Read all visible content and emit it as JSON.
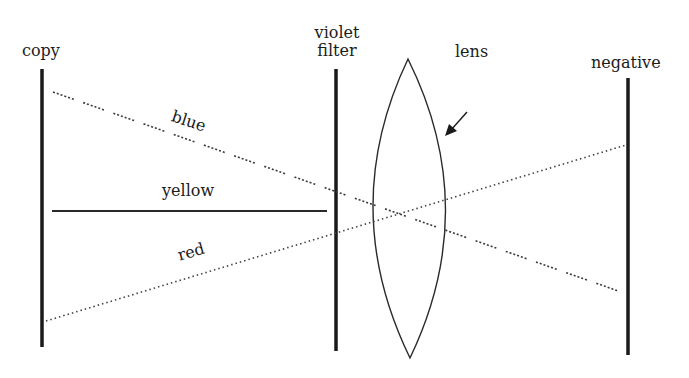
{
  "diagram": {
    "type": "optical-ray-diagram",
    "elements": {
      "copy": {
        "label": "copy"
      },
      "violet_filter": {
        "label_line1": "violet",
        "label_line2": "filter"
      },
      "lens": {
        "label": "lens"
      },
      "negative": {
        "label": "negative"
      }
    },
    "rays": {
      "blue": {
        "label": "blue",
        "style": "dashed"
      },
      "yellow": {
        "label": "yellow",
        "style": "solid"
      },
      "red": {
        "label": "red",
        "style": "dotted"
      }
    },
    "colors": {
      "ink": "#1a1a1a",
      "ray": "#444444",
      "background": "#ffffff"
    }
  }
}
